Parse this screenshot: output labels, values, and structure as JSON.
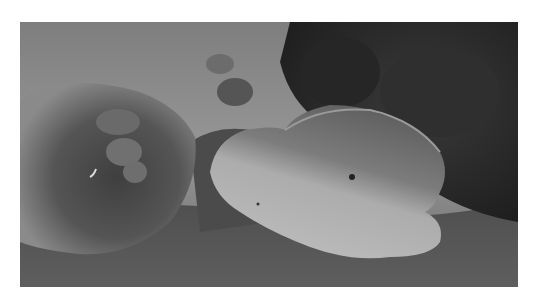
{
  "image": {
    "alt": "Grayscale underwater photograph of a reef: a large rounded coral mound on the left, a flat plate/table coral in the center-right, and dark dense coral thickets in the upper right, with hazy water in the upper left and rubble seafloor below.",
    "subjects": [
      {
        "name": "coral-mound",
        "position": "left"
      },
      {
        "name": "plate-coral",
        "position": "center-right"
      },
      {
        "name": "dark-coral-thicket",
        "position": "upper-right"
      },
      {
        "name": "hazy-open-water",
        "position": "upper-left"
      },
      {
        "name": "seafloor-rubble",
        "position": "bottom"
      }
    ],
    "colors": {
      "background": "#ffffff",
      "water_haze": "#8f8f8f",
      "dark_coral": "#2b2b2b",
      "mound": "#5a5a5a",
      "plate_light": "#b9b9b9",
      "plate_dark": "#6a6a6a",
      "floor": "#4a4a4a"
    }
  }
}
